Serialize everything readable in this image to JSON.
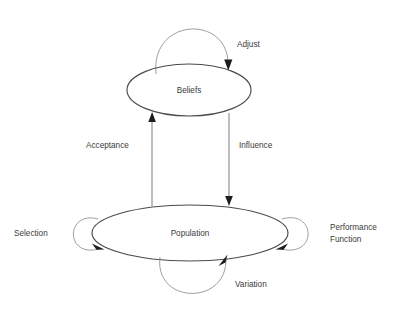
{
  "diagram": {
    "background_color": "#ffffff",
    "node_stroke_color": "#4a4a4a",
    "loop_stroke_color": "#8d8d8d",
    "arrow_color": "#1d1d1d",
    "text_color": "#3b3b3b",
    "nodes": [
      {
        "id": "beliefs",
        "label": "Beliefs",
        "shape": "ellipse",
        "cx": 189,
        "cy": 90,
        "rx": 62,
        "ry": 26
      },
      {
        "id": "population",
        "label": "Population",
        "shape": "ellipse",
        "cx": 190,
        "cy": 233,
        "rx": 98,
        "ry": 28
      }
    ],
    "edges": [
      {
        "id": "adjust",
        "label": "Adjust",
        "from": "beliefs",
        "to": "beliefs",
        "kind": "self-loop",
        "position": "top",
        "label_x": 237,
        "label_y": 47
      },
      {
        "id": "acceptance",
        "label": "Acceptance",
        "from": "population",
        "to": "beliefs",
        "kind": "straight",
        "direction": "up",
        "label_x": 86,
        "label_y": 148
      },
      {
        "id": "influence",
        "label": "Influence",
        "from": "beliefs",
        "to": "population",
        "kind": "straight",
        "direction": "down",
        "label_x": 239,
        "label_y": 148
      },
      {
        "id": "selection",
        "label": "Selection",
        "from": "population",
        "to": "population",
        "kind": "self-loop",
        "position": "left",
        "label_x": 14,
        "label_y": 236
      },
      {
        "id": "performance-function",
        "label": "Performance Function",
        "label_line_1": "Performance",
        "label_line_2": "Function",
        "from": "population",
        "to": "population",
        "kind": "self-loop",
        "position": "right",
        "label_x": 330,
        "label_y": 230
      },
      {
        "id": "variation",
        "label": "Variation",
        "from": "population",
        "to": "population",
        "kind": "self-loop",
        "position": "bottom",
        "label_x": 235,
        "label_y": 287
      }
    ]
  }
}
